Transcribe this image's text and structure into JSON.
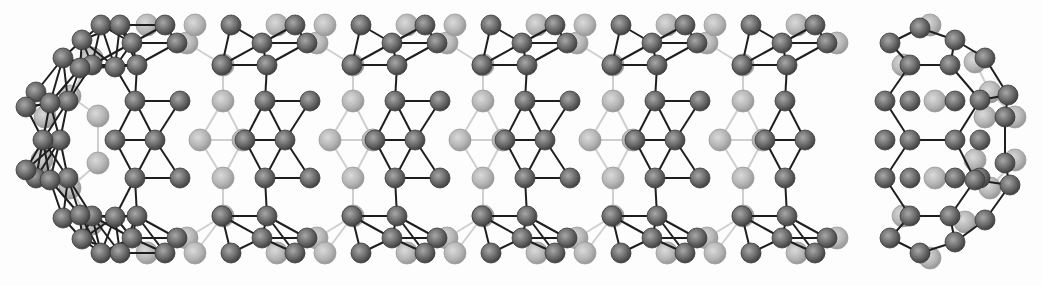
{
  "figure": {
    "width": 1042,
    "height": 286,
    "background": "#fdfdfd",
    "colors": {
      "front_atom": "#6e6e6e",
      "front_atom_highlight": "#9a9a9a",
      "front_atom_stroke": "#3a3a3a",
      "back_atom": "#b4b4b4",
      "back_atom_highlight": "#d4d4d4",
      "back_atom_stroke": "#9c9c9c",
      "front_bond": "#1e1e1e",
      "back_bond": "#cfcfcf"
    },
    "radius": {
      "front": 10,
      "back": 11
    }
  },
  "tube": {
    "period": 130,
    "repeats": 6,
    "x0": 135,
    "unit_front_atoms": [
      [
        0,
        101
      ],
      [
        45,
        101
      ],
      [
        -20,
        140
      ],
      [
        20,
        140
      ],
      [
        0,
        178
      ],
      [
        45,
        178
      ],
      [
        -43,
        65
      ],
      [
        2,
        65
      ],
      [
        -43,
        216
      ],
      [
        2,
        216
      ],
      [
        -3,
        43
      ],
      [
        42,
        43
      ],
      [
        -3,
        238
      ],
      [
        42,
        238
      ],
      [
        -34,
        25
      ],
      [
        30,
        25
      ],
      [
        -34,
        253
      ],
      [
        30,
        253
      ]
    ],
    "unit_back_atoms": [
      [
        88,
        101
      ],
      [
        88,
        178
      ],
      [
        65,
        140
      ],
      [
        108,
        140
      ],
      [
        88,
        65
      ],
      [
        88,
        216
      ],
      [
        52,
        43
      ],
      [
        52,
        238
      ],
      [
        12,
        25
      ],
      [
        12,
        253
      ],
      [
        60,
        25
      ],
      [
        60,
        253
      ]
    ],
    "left_cap_front_atoms": [
      [
        68,
        101
      ],
      [
        60,
        140
      ],
      [
        68,
        178
      ],
      [
        43,
        140
      ],
      [
        36,
        92
      ],
      [
        36,
        178
      ],
      [
        26,
        107
      ],
      [
        26,
        170
      ],
      [
        50,
        103
      ],
      [
        50,
        180
      ],
      [
        63,
        58
      ],
      [
        63,
        218
      ],
      [
        82,
        40
      ],
      [
        82,
        239
      ],
      [
        80,
        68
      ],
      [
        80,
        215
      ],
      [
        120,
        25
      ],
      [
        120,
        253
      ],
      [
        115,
        67
      ],
      [
        115,
        217
      ]
    ],
    "left_cap_back_atoms": [
      [
        45,
        117
      ],
      [
        42,
        160
      ],
      [
        98,
        116
      ],
      [
        98,
        163
      ],
      [
        70,
        96
      ],
      [
        70,
        188
      ],
      [
        92,
        58
      ],
      [
        92,
        224
      ]
    ]
  },
  "end_cap": {
    "front_atoms": [
      [
        910,
        101
      ],
      [
        955,
        101
      ],
      [
        885,
        140
      ],
      [
        910,
        140
      ],
      [
        955,
        140
      ],
      [
        980,
        140
      ],
      [
        885,
        101
      ],
      [
        885,
        178
      ],
      [
        910,
        178
      ],
      [
        955,
        178
      ],
      [
        980,
        178
      ],
      [
        910,
        65
      ],
      [
        950,
        65
      ],
      [
        910,
        216
      ],
      [
        950,
        216
      ],
      [
        890,
        43
      ],
      [
        920,
        28
      ],
      [
        955,
        40
      ],
      [
        985,
        58
      ],
      [
        1008,
        95
      ],
      [
        1005,
        117
      ],
      [
        1005,
        163
      ],
      [
        1010,
        185
      ],
      [
        890,
        238
      ],
      [
        920,
        253
      ],
      [
        955,
        242
      ],
      [
        985,
        220
      ],
      [
        975,
        180
      ],
      [
        980,
        100
      ]
    ],
    "back_atoms": [
      [
        935,
        101
      ],
      [
        935,
        178
      ],
      [
        930,
        25
      ],
      [
        930,
        258
      ],
      [
        975,
        62
      ],
      [
        990,
        92
      ],
      [
        985,
        117
      ],
      [
        1015,
        117
      ],
      [
        1015,
        160
      ],
      [
        975,
        160
      ],
      [
        990,
        188
      ],
      [
        965,
        222
      ],
      [
        903,
        65
      ],
      [
        903,
        216
      ]
    ],
    "front_bonds": [
      [
        [
          910,
          140
        ],
        [
          955,
          140
        ]
      ],
      [
        [
          885,
          101
        ],
        [
          910,
          140
        ]
      ],
      [
        [
          910,
          140
        ],
        [
          885,
          178
        ]
      ],
      [
        [
          955,
          140
        ],
        [
          980,
          100
        ]
      ],
      [
        [
          955,
          140
        ],
        [
          975,
          180
        ]
      ],
      [
        [
          885,
          101
        ],
        [
          910,
          65
        ]
      ],
      [
        [
          910,
          65
        ],
        [
          950,
          65
        ]
      ],
      [
        [
          950,
          65
        ],
        [
          980,
          100
        ]
      ],
      [
        [
          885,
          178
        ],
        [
          910,
          216
        ]
      ],
      [
        [
          910,
          216
        ],
        [
          950,
          216
        ]
      ],
      [
        [
          950,
          216
        ],
        [
          975,
          180
        ]
      ],
      [
        [
          910,
          65
        ],
        [
          890,
          43
        ]
      ],
      [
        [
          890,
          43
        ],
        [
          920,
          28
        ]
      ],
      [
        [
          920,
          28
        ],
        [
          955,
          40
        ]
      ],
      [
        [
          955,
          40
        ],
        [
          950,
          65
        ]
      ],
      [
        [
          955,
          40
        ],
        [
          985,
          58
        ]
      ],
      [
        [
          985,
          58
        ],
        [
          1008,
          95
        ]
      ],
      [
        [
          1008,
          95
        ],
        [
          980,
          100
        ]
      ],
      [
        [
          1008,
          95
        ],
        [
          1005,
          117
        ]
      ],
      [
        [
          1005,
          117
        ],
        [
          1005,
          163
        ]
      ],
      [
        [
          1005,
          163
        ],
        [
          1010,
          185
        ]
      ],
      [
        [
          1010,
          185
        ],
        [
          975,
          180
        ]
      ],
      [
        [
          1010,
          185
        ],
        [
          985,
          220
        ]
      ],
      [
        [
          985,
          220
        ],
        [
          955,
          242
        ]
      ],
      [
        [
          955,
          242
        ],
        [
          950,
          216
        ]
      ],
      [
        [
          955,
          242
        ],
        [
          920,
          253
        ]
      ],
      [
        [
          920,
          253
        ],
        [
          890,
          238
        ]
      ],
      [
        [
          890,
          238
        ],
        [
          910,
          216
        ]
      ]
    ]
  }
}
